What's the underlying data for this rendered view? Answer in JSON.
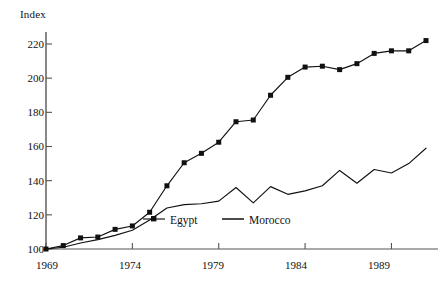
{
  "chart_data": {
    "type": "line",
    "title": "",
    "ylabel": "Index",
    "xlabel": "",
    "xlim": [
      1969,
      1991
    ],
    "ylim": [
      100,
      224
    ],
    "grid": false,
    "legend_position": "inside-bottom-center",
    "y_ticks": [
      100,
      120,
      140,
      160,
      180,
      200,
      220
    ],
    "x_ticks": [
      1969,
      1974,
      1979,
      1984,
      1989
    ],
    "x": [
      1969,
      1970,
      1971,
      1972,
      1973,
      1974,
      1975,
      1976,
      1977,
      1978,
      1979,
      1980,
      1981,
      1982,
      1983,
      1984,
      1985,
      1986,
      1987,
      1988,
      1989,
      1990,
      1991
    ],
    "series": [
      {
        "name": "Egypt",
        "marker": "filled-square",
        "color": "#111111",
        "values": [
          100,
          102,
          106.5,
          107,
          111.5,
          113.5,
          121.5,
          137,
          150.5,
          156,
          162.5,
          174.5,
          175.5,
          190,
          200.5,
          206.5,
          207,
          205,
          208.5,
          214.5,
          216,
          216,
          222
        ]
      },
      {
        "name": "Morocco",
        "marker": "none",
        "color": "#111111",
        "values": [
          100,
          101,
          103.5,
          105.5,
          108,
          111,
          117,
          124,
          126,
          126.5,
          128,
          136,
          127,
          136.5,
          132,
          134,
          137,
          146,
          138.5,
          146.5,
          144.5,
          150,
          159
        ]
      }
    ]
  },
  "axis": {
    "y_title": "Index",
    "y_tick_labels": [
      "220",
      "200",
      "180",
      "160",
      "140",
      "120",
      "100"
    ],
    "x_tick_labels": [
      "1969",
      "1974",
      "1979",
      "1984",
      "1989"
    ]
  },
  "legend": {
    "items": [
      {
        "label": "Egypt",
        "style": "line-with-marker"
      },
      {
        "label": "Morocco",
        "style": "line"
      }
    ]
  }
}
